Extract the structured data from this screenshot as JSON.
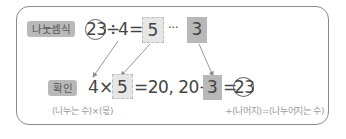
{
  "division": {
    "label": "나눗셈식",
    "dividend": "23",
    "operator_div": "÷",
    "divisor": "4",
    "equals": "=",
    "quotient": "5",
    "ellipsis": "···",
    "remainder": "3"
  },
  "check": {
    "label": "확인",
    "divisor": "4",
    "times": "×",
    "quotient": "5",
    "mid_text": "=20, 20+",
    "remainder": "3",
    "equals": "=",
    "result": "23"
  },
  "captions": {
    "left": "(나누는 수)×(몫)",
    "right": "+(나머지)=(나누어지는 수)"
  },
  "colors": {
    "quotient_box": "#e6e6e6",
    "remainder_box": "#b8b8b8",
    "label_pill": "#b9b9b9",
    "border": "#8a8a8a",
    "arrow": "#8c8c8c"
  }
}
